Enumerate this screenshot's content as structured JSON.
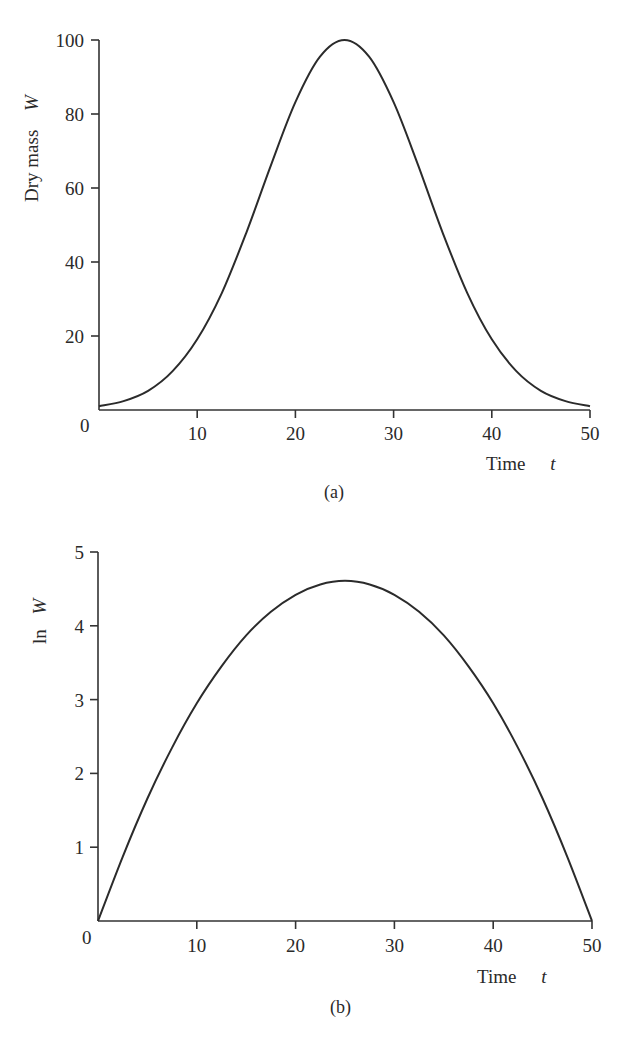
{
  "chart_data": [
    {
      "id": "a",
      "type": "line",
      "caption": "(a)",
      "title": "",
      "xlabel": "Time",
      "xlabel_var": "t",
      "ylabel": "Dry mass",
      "ylabel_var": "W",
      "xlim": [
        0,
        50
      ],
      "ylim": [
        0,
        100
      ],
      "x_ticks": [
        0,
        10,
        20,
        30,
        40,
        50
      ],
      "x_tick_labels": [
        "",
        "10",
        "20",
        "30",
        "40",
        "50"
      ],
      "y_ticks": [
        20,
        40,
        60,
        80,
        100
      ],
      "y_tick_labels": [
        "20",
        "40",
        "60",
        "80",
        "100"
      ],
      "origin_label": "0",
      "grid": false,
      "legend": null,
      "series": [
        {
          "name": "W(t)",
          "x": [
            0,
            2.5,
            5,
            7.5,
            10,
            12.5,
            15,
            17.5,
            20,
            22.5,
            25,
            27.5,
            30,
            32.5,
            35,
            37.5,
            40,
            42.5,
            45,
            47.5,
            50
          ],
          "values": [
            1.0,
            2.4,
            5.2,
            10.5,
            19.1,
            31.6,
            47.9,
            66.1,
            83.2,
            95.5,
            100.0,
            95.5,
            83.2,
            66.1,
            47.9,
            31.6,
            19.1,
            10.5,
            5.2,
            2.4,
            1.0
          ]
        }
      ]
    },
    {
      "id": "b",
      "type": "line",
      "caption": "(b)",
      "title": "",
      "xlabel": "Time",
      "xlabel_var": "t",
      "ylabel": "ln",
      "ylabel_var": "W",
      "xlim": [
        0,
        50
      ],
      "ylim": [
        0,
        5
      ],
      "x_ticks": [
        0,
        10,
        20,
        30,
        40,
        50
      ],
      "x_tick_labels": [
        "",
        "10",
        "20",
        "30",
        "40",
        "50"
      ],
      "y_ticks": [
        1,
        2,
        3,
        4,
        5
      ],
      "y_tick_labels": [
        "1",
        "2",
        "3",
        "4",
        "5"
      ],
      "origin_label": "0",
      "grid": false,
      "legend": null,
      "series": [
        {
          "name": "ln W(t)",
          "x": [
            0,
            2.5,
            5,
            7.5,
            10,
            12.5,
            15,
            17.5,
            20,
            22.5,
            25,
            27.5,
            30,
            32.5,
            35,
            37.5,
            40,
            42.5,
            45,
            47.5,
            50
          ],
          "values": [
            0.0,
            0.87,
            1.66,
            2.35,
            2.95,
            3.45,
            3.87,
            4.19,
            4.42,
            4.56,
            4.61,
            4.56,
            4.42,
            4.19,
            3.87,
            3.45,
            2.95,
            2.35,
            1.66,
            0.87,
            0.0
          ]
        }
      ]
    }
  ]
}
